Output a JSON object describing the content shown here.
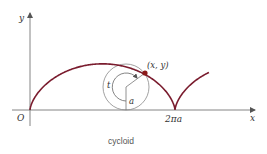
{
  "figure": {
    "caption": "cycloid",
    "labels": {
      "y_axis": "y",
      "x_axis": "x",
      "origin": "O",
      "point": "(x, y)",
      "angle": "t",
      "radius": "a",
      "period": "2πa"
    },
    "colors": {
      "curve": "#7a1c2e",
      "point": "#8b1a1a",
      "axes": "#666666",
      "circle": "#888888"
    }
  }
}
